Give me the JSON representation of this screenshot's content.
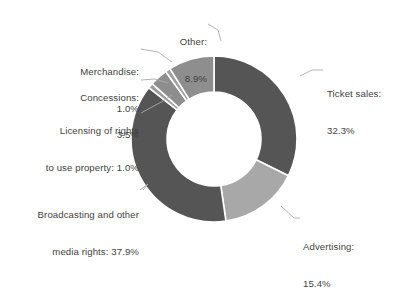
{
  "chart_data": {
    "type": "pie",
    "variant": "donut",
    "title": "",
    "subtitle": "",
    "xlabel": "",
    "ylabel": "",
    "legend_position": "none",
    "grid": false,
    "units": "percent",
    "total": 100.0,
    "categories": [
      "Ticket sales",
      "Advertising",
      "Broadcasting and other media rights",
      "Licensing of rights to use property",
      "Concessions",
      "Merchandise",
      "Other"
    ],
    "values": [
      32.3,
      15.4,
      37.9,
      1.0,
      3.5,
      1.0,
      8.9
    ],
    "slices": [
      {
        "name": "Ticket sales",
        "value": 32.3,
        "value_text": "32.3%",
        "label_line1": "Ticket sales:",
        "label_line2": "32.3%",
        "color": "#555555",
        "start_angle": 0.0,
        "end_angle": 116.28
      },
      {
        "name": "Advertising",
        "value": 15.4,
        "value_text": "15.4%",
        "label_line1": "Advertising:",
        "label_line2": "15.4%",
        "color": "#a8a8a8",
        "start_angle": 116.28,
        "end_angle": 171.72
      },
      {
        "name": "Broadcasting and other media rights",
        "value": 37.9,
        "value_text": "37.9%",
        "label_line1": "Broadcasting and other",
        "label_line2": "media rights: 37.9%",
        "color": "#555555",
        "start_angle": 171.72,
        "end_angle": 308.16
      },
      {
        "name": "Licensing of rights to use property",
        "value": 1.0,
        "value_text": "1.0%",
        "label_line1": "Licensing of rights",
        "label_line2": "to use property: 1.0%",
        "color": "#9d9d9d",
        "start_angle": 308.16,
        "end_angle": 311.76
      },
      {
        "name": "Concessions",
        "value": 3.5,
        "value_text": "3.5%",
        "label_line1": "Concessions:",
        "label_line2": "3.5%",
        "color": "#8e8e8e",
        "start_angle": 311.76,
        "end_angle": 324.36
      },
      {
        "name": "Merchandise",
        "value": 1.0,
        "value_text": "1.0%",
        "label_line1": "Merchandise:",
        "label_line2": "1.0%",
        "color": "#a0a0a0",
        "start_angle": 324.36,
        "end_angle": 327.96
      },
      {
        "name": "Other",
        "value": 8.9,
        "value_text": "8.9%",
        "label_line1": "Other:",
        "label_line2": "8.9%",
        "color": "#8e8e8e",
        "start_angle": 327.96,
        "end_angle": 360.0
      }
    ],
    "colors": {
      "dark_gray": "#555555",
      "mid_gray": "#8e8e8e",
      "light_gray": "#a8a8a8",
      "separator": "#ffffff",
      "leader_line": "#aaaaaa",
      "text": "#3f3f3f",
      "background": "#ffffff"
    },
    "geometry": {
      "center_x": 214,
      "center_y": 139,
      "outer_radius": 83,
      "inner_radius": 47
    }
  }
}
